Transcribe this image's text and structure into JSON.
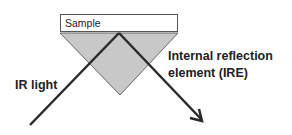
{
  "diagram": {
    "sample_label": "Sample",
    "ire_label_line1": "Internal reflection",
    "ire_label_line2": "element (IRE)",
    "light_label": "IR light",
    "colors": {
      "prism": "#c8c8c8",
      "line": "#2a2a2a",
      "outline": "#555555"
    }
  }
}
